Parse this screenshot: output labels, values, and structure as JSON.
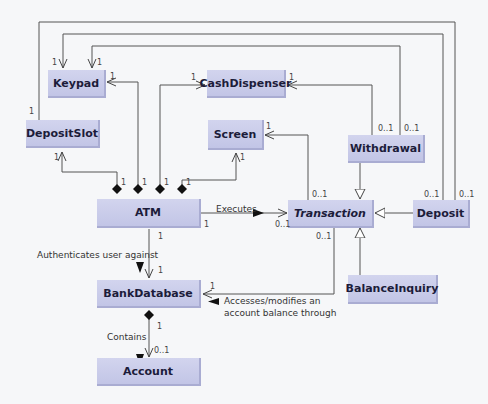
{
  "classes": {
    "keypad": "Keypad",
    "cash_dispenser": "CashDispenser",
    "deposit_slot": "DepositSlot",
    "screen": "Screen",
    "withdrawal": "Withdrawal",
    "atm": "ATM",
    "transaction": "Transaction",
    "deposit": "Deposit",
    "bank_database": "BankDatabase",
    "balance_inquiry": "BalanceInquiry",
    "account": "Account"
  },
  "associations": {
    "executes": "Executes",
    "authenticates": "Authenticates user against",
    "accesses_line1": "Accesses/modifies an",
    "accesses_line2": "account balance through",
    "contains": "Contains"
  },
  "multiplicities": {
    "one": "1",
    "zero_one": "0..1"
  },
  "colors": {
    "class_fill": "#c8cbea",
    "line": "#444444",
    "background": "#f6f7f9"
  }
}
